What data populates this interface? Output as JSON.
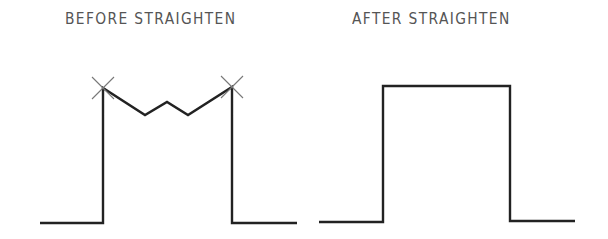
{
  "panels": [
    {
      "title": "BEFORE STRAIGHTEN",
      "polyline": [
        [
          40,
          223
        ],
        [
          103,
          223
        ],
        [
          103,
          88
        ],
        [
          145,
          115
        ],
        [
          167,
          102
        ],
        [
          188,
          115
        ],
        [
          232,
          87
        ],
        [
          232,
          223
        ],
        [
          297,
          223
        ]
      ],
      "markers": [
        [
          103,
          88
        ],
        [
          232,
          87
        ]
      ]
    },
    {
      "title": "AFTER STRAIGHTEN",
      "polyline": [
        [
          319,
          222
        ],
        [
          383,
          222
        ],
        [
          383,
          86
        ],
        [
          510,
          86
        ],
        [
          510,
          221
        ],
        [
          575,
          221
        ]
      ],
      "markers": []
    }
  ],
  "colors": {
    "line": "#222222",
    "marker": "#777777",
    "text": "#555555"
  }
}
